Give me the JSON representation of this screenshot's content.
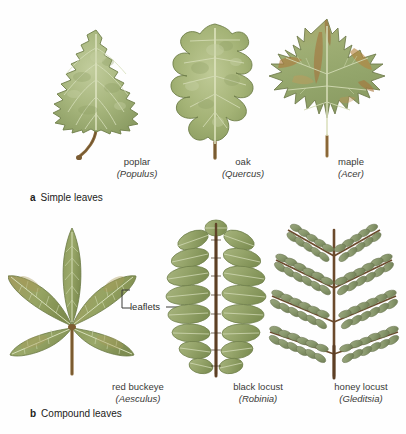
{
  "figure": {
    "title_visible": false,
    "background": "#fefefe",
    "palette": {
      "leaf_green": "#9bab72",
      "leaf_green_light": "#b3c08d",
      "leaf_green_dark": "#6f7f4a",
      "vein": "#d9dfbe",
      "petiole": "#8a6a3c",
      "petiole_dark": "#6b4f2a",
      "autumn_brown": "#a6763f",
      "autumn_tan": "#c99a58",
      "locust_sage": "#8d9a76",
      "rachis": "#6b4a2c",
      "text": "#3a3a38",
      "outline": "#7a7350"
    }
  },
  "sections": [
    {
      "tag": "a",
      "label": "Simple leaves",
      "leaves": [
        {
          "common": "poplar",
          "scientific": "(Populus)",
          "shape": "deltoid-serrate",
          "icon": "poplar-leaf-icon"
        },
        {
          "common": "oak",
          "scientific": "(Quercus)",
          "shape": "lobed-rounded",
          "icon": "oak-leaf-icon"
        },
        {
          "common": "maple",
          "scientific": "(Acer)",
          "shape": "palmate-lobed",
          "icon": "maple-leaf-icon"
        }
      ]
    },
    {
      "tag": "b",
      "label": "Compound leaves",
      "annotation": "leaflets",
      "leaves": [
        {
          "common": "red buckeye",
          "scientific": "(Aesculus)",
          "shape": "palmately-compound",
          "icon": "red-buckeye-leaf-icon"
        },
        {
          "common": "black locust",
          "scientific": "(Robinia)",
          "shape": "pinnately-compound",
          "icon": "black-locust-leaf-icon"
        },
        {
          "common": "honey locust",
          "scientific": "(Gleditsia)",
          "shape": "bipinnately-compound",
          "icon": "honey-locust-leaf-icon"
        }
      ]
    }
  ]
}
